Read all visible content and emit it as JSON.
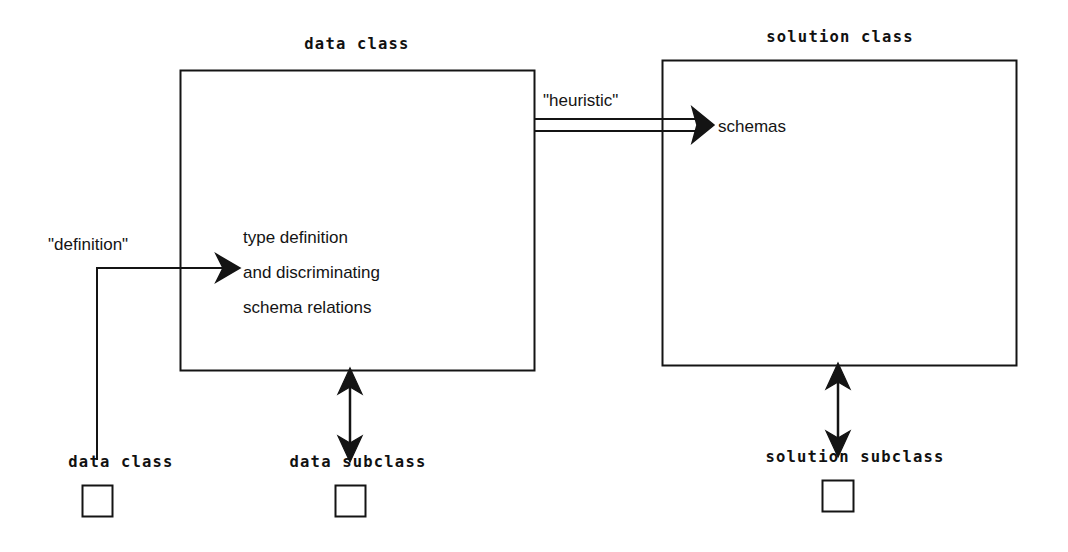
{
  "diagram": {
    "type": "block-diagram",
    "background_color": "#ffffff",
    "stroke_color": "#141414",
    "text_color": "#141414",
    "boxes": [
      {
        "id": "data-class-box",
        "caption": "data class",
        "x": 180,
        "y": 70,
        "width": 354,
        "height": 300,
        "body_lines": [
          "type definition",
          "and discriminating",
          "schema relations"
        ]
      },
      {
        "id": "solution-class-box",
        "caption": "solution class",
        "x": 662,
        "y": 60,
        "width": 354,
        "height": 305,
        "body_lines": [
          "schemas"
        ]
      }
    ],
    "arrows": [
      {
        "id": "definition-arrow",
        "label": "\"definition\"",
        "style": "single-line-elbow",
        "from": "data class legend square",
        "to": "data class box"
      },
      {
        "id": "heuristic-arrow",
        "label": "\"heuristic\"",
        "style": "double-line",
        "from": "data class box",
        "to": "solution class box"
      },
      {
        "id": "data-subclass-arrow",
        "label": "",
        "style": "vertical-double-headed",
        "from": "data class box",
        "to": "data subclass legend square"
      },
      {
        "id": "solution-subclass-arrow",
        "label": "",
        "style": "vertical-double-headed",
        "from": "solution class box",
        "to": "solution subclass legend square"
      }
    ],
    "legend": [
      {
        "id": "legend-data-class",
        "label": "data class",
        "square_x": 82,
        "square_y": 485,
        "square_size": 30
      },
      {
        "id": "legend-data-subclass",
        "label": "data subclass",
        "square_x": 335,
        "square_y": 485,
        "square_size": 30
      },
      {
        "id": "legend-solution-subclass",
        "label": "solution subclass",
        "square_x": 822,
        "square_y": 480,
        "square_size": 30
      }
    ],
    "labels": {
      "data_class_caption": "data class",
      "solution_class_caption": "solution class",
      "definition_arrow_label": "\"definition\"",
      "heuristic_arrow_label": "\"heuristic\"",
      "schemas_text": "schemas",
      "type_definition_line1": "type definition",
      "type_definition_line2": "and discriminating",
      "type_definition_line3": "schema relations",
      "legend_data_class": "data class",
      "legend_data_subclass": "data subclass",
      "legend_solution_subclass": "solution subclass"
    }
  }
}
